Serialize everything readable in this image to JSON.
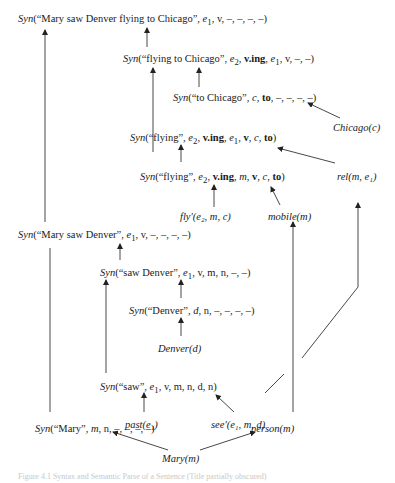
{
  "diagram": {
    "nodes": {
      "n1": {
        "pre": "Syn",
        "text": "(“Mary saw Denver flying to Chicago”, ",
        "var": "e",
        "sub": "1",
        "rest": ", v, –, –, –, –)"
      },
      "n2": {
        "pre": "Syn",
        "text": "(“flying to Chicago”, ",
        "a": "e",
        "asub": "2",
        "b": "v.ing",
        "c": "e",
        "csub": "1",
        "rest": ", v, –, –)"
      },
      "n3": {
        "pre": "Syn",
        "text": "(“to Chicago”, ",
        "var": "c",
        "bold": "to",
        "rest": ", –, –, –, –)"
      },
      "n4": {
        "label": "Chicago(c)"
      },
      "n5": {
        "pre": "Syn",
        "text": "(“flying”, ",
        "a": "e",
        "asub": "2",
        "b": "v.ing",
        "c": "e",
        "csub": "1",
        "rest1": "v",
        "rest2": "c",
        "rest3": "to"
      },
      "n6": {
        "pre": "Syn",
        "text": "(“flying”, ",
        "a": "e",
        "asub": "2",
        "b": "v.ing",
        "c": "m",
        "rest1": "v",
        "rest2": "c",
        "rest3": "to"
      },
      "n7": {
        "label": "rel(m, e₁)"
      },
      "n8": {
        "label": "fly′(e₂, m, c)"
      },
      "n9": {
        "label": "mobile(m)"
      },
      "n10": {
        "pre": "Syn",
        "text": "(“Mary saw Denver”, ",
        "var": "e",
        "sub": "1",
        "rest": ", v, –, –, –, –)"
      },
      "n11": {
        "pre": "Syn",
        "text": "(“saw Denver”, ",
        "var": "e",
        "sub": "1",
        "rest": ", v, m, n, –, –)"
      },
      "n12": {
        "pre": "Syn",
        "text": "(“Denver”, ",
        "var": "d",
        "rest": ", n, –, –, –, –)"
      },
      "n13": {
        "label": "Denver(d)"
      },
      "n14": {
        "pre": "Syn",
        "text": "(“saw”, ",
        "var": "e",
        "sub": "1",
        "rest": ", v, m, n, d, n)"
      },
      "n15": {
        "label": "past(e₁)"
      },
      "n16": {
        "label": "see′(e₁, m, d)"
      },
      "n17": {
        "pre": "Syn",
        "text": "(“Mary”, ",
        "var": "m",
        "rest": ", n, –, –, –, –)"
      },
      "n18": {
        "label": "person(m)"
      },
      "n19": {
        "label": "Mary(m)"
      }
    },
    "caption": "Figure 4.1   Syntax and Semantic Parse of a Sentence (Title partially obscured)"
  }
}
